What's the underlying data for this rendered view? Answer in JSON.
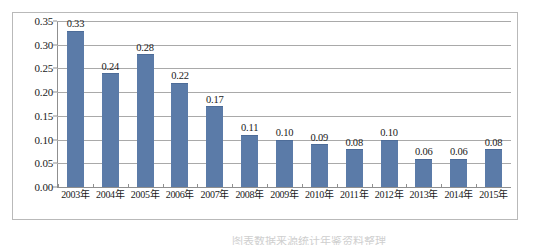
{
  "chart_data": {
    "type": "bar",
    "title": "",
    "xlabel": "",
    "ylabel": "",
    "categories": [
      "2003年",
      "2004年",
      "2005年",
      "2006年",
      "2007年",
      "2008年",
      "2009年",
      "2010年",
      "2011年",
      "2012年",
      "2013年",
      "2014年",
      "2015年"
    ],
    "values": [
      0.33,
      0.24,
      0.28,
      0.22,
      0.17,
      0.11,
      0.1,
      0.09,
      0.08,
      0.1,
      0.06,
      0.06,
      0.08
    ],
    "value_labels": [
      "0.33",
      "0.24",
      "0.28",
      "0.22",
      "0.17",
      "0.11",
      "0.10",
      "0.09",
      "0.08",
      "0.10",
      "0.06",
      "0.06",
      "0.08"
    ],
    "ylim": [
      0.0,
      0.35
    ],
    "ytick_values": [
      0.0,
      0.05,
      0.1,
      0.15,
      0.2,
      0.25,
      0.3,
      0.35
    ],
    "ytick_labels": [
      "0.00",
      "0.05",
      "0.10",
      "0.15",
      "0.20",
      "0.25",
      "0.30",
      "0.35"
    ],
    "grid": true,
    "legend": "none",
    "series_color": "#5b7ba8",
    "gridline_color": "#a9a9a9",
    "axis_color": "#8f8f8f",
    "frame_color": "#b9b9b9",
    "background": "#ffffff"
  },
  "caption": {
    "scrap_text": "图表数据来源统计年鉴资料整理"
  }
}
